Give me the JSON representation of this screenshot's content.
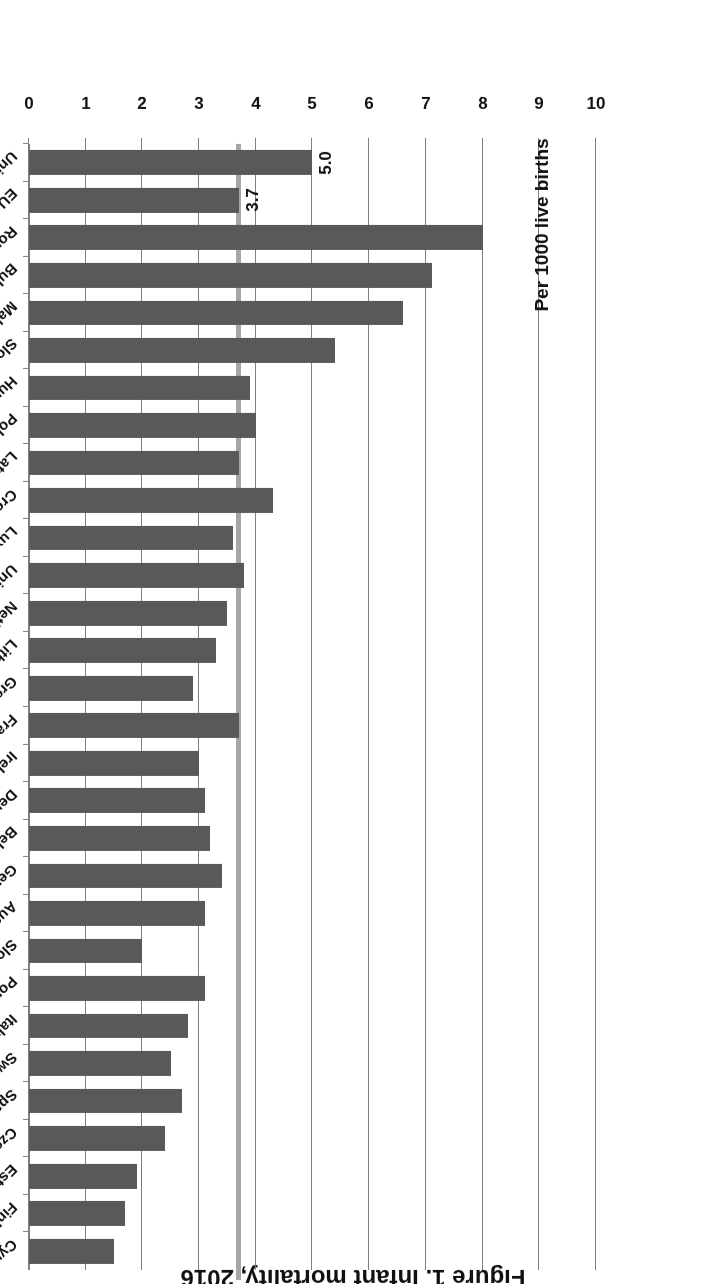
{
  "chart_data": {
    "type": "bar",
    "orientation": "horizontal",
    "title": "Figure 1. Infant mortality, 2016",
    "xlabel": "",
    "ylabel": "Per 1000 live births",
    "axis_note": "Per 1000 live births",
    "ylim": [
      0,
      10
    ],
    "ticks": [
      "0",
      "1",
      "2",
      "3",
      "4",
      "5",
      "6",
      "7",
      "8",
      "9",
      "10"
    ],
    "grid": true,
    "legend": null,
    "reference_line": {
      "label": "EU-28 average",
      "value": 3.7,
      "color": "#a6a6a6"
    },
    "bar_color": "#595959",
    "categories": [
      "Cyprus",
      "Finland",
      "Estonia",
      "Czech Republic",
      "Spain",
      "Sweden",
      "Italy",
      "Portugal",
      "Slovenia",
      "Austria",
      "Germany",
      "Belgium",
      "Denmark",
      "Ireland",
      "France",
      "Greece",
      "Lithuania",
      "Netherlands",
      "United Kingdom",
      "Luxembourg",
      "Croatia",
      "Latvia",
      "Poland",
      "Hungary",
      "Slovakia",
      "Malta",
      "Bulgaria",
      "Romania",
      "EU-28",
      "United States*"
    ],
    "values": [
      1.5,
      1.7,
      1.9,
      2.4,
      2.7,
      2.5,
      2.8,
      3.1,
      2.0,
      3.1,
      3.4,
      3.2,
      3.1,
      3.0,
      3.7,
      2.9,
      3.3,
      3.5,
      3.8,
      3.6,
      4.3,
      3.7,
      4.0,
      3.9,
      5.4,
      6.6,
      7.1,
      8.0,
      3.7,
      5.0
    ],
    "data_labels": [
      {
        "category": "EU-28",
        "text": "3.7"
      },
      {
        "category": "United States*",
        "text": "5.0"
      }
    ],
    "footnote_marker": "*"
  },
  "figure": {
    "title": "Figure 1. Infant mortality, 2016",
    "note": "Per 1000 live births"
  }
}
